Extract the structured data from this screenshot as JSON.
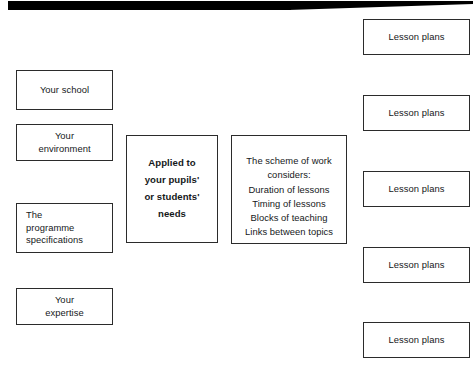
{
  "diagram": {
    "background_color": "#ffffff",
    "border_color": "#2b2b2b",
    "text_color": "#15181a",
    "artifact": {
      "name": "scan-artifact-bar",
      "color": "#000000"
    },
    "inputs": [
      {
        "label": "Your school",
        "align": "center"
      },
      {
        "label": "Your\nenvironment",
        "align": "center"
      },
      {
        "label": "The\nprogramme\nspecifications",
        "align": "left"
      },
      {
        "label": "Your\nexpertise",
        "align": "center"
      }
    ],
    "center": [
      {
        "label": "Applied to\nyour pupils'\nor students'\nneeds",
        "emphasis": "bold"
      },
      {
        "label": "The scheme of work\nconsiders:\nDuration of lessons\nTiming of lessons\nBlocks of teaching\nLinks between topics",
        "emphasis": "normal"
      }
    ],
    "outputs": [
      {
        "label": "Lesson plans"
      },
      {
        "label": "Lesson plans"
      },
      {
        "label": "Lesson plans"
      },
      {
        "label": "Lesson plans"
      },
      {
        "label": "Lesson plans"
      }
    ]
  }
}
